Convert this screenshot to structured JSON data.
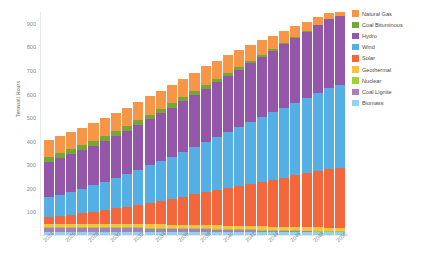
{
  "chart_data": {
    "type": "bar",
    "stacked": true,
    "title": "",
    "subtitle": "",
    "xlabel": "",
    "ylabel": "Terawatt Hours",
    "ylim": [
      0,
      950
    ],
    "yticks": [
      100,
      200,
      300,
      400,
      500,
      600,
      700,
      800,
      900
    ],
    "grid": false,
    "legend_position": "right",
    "x": [
      "2024",
      "2025",
      "2026",
      "2027",
      "2028",
      "2029",
      "2030",
      "2031",
      "2032",
      "2033",
      "2034",
      "2035",
      "2036",
      "2037",
      "2038",
      "2039",
      "2040",
      "2041",
      "2042",
      "2043",
      "2044",
      "2045",
      "2046",
      "2047",
      "2048",
      "2049",
      "2050"
    ],
    "xtick_labels": [
      "2024",
      "",
      "2026",
      "",
      "2028",
      "",
      "2030",
      "",
      "2032",
      "",
      "2034",
      "",
      "2036",
      "",
      "2038",
      "",
      "2040",
      "",
      "2042",
      "",
      "2044",
      "",
      "2046",
      "",
      "2048",
      "",
      "2050"
    ],
    "categories": [
      "2024",
      "2025",
      "2026",
      "2027",
      "2028",
      "2029",
      "2030",
      "2031",
      "2032",
      "2033",
      "2034",
      "2035",
      "2036",
      "2037",
      "2038",
      "2039",
      "2040",
      "2041",
      "2042",
      "2043",
      "2044",
      "2045",
      "2046",
      "2047",
      "2048",
      "2049",
      "2050"
    ],
    "stack_order_bottom_to_top": [
      "Biomass",
      "Coal Lignite",
      "Nuclear",
      "Geothermal",
      "Solar",
      "Wind",
      "Hydro",
      "Coal Bituminous",
      "Natural Gas"
    ],
    "series": [
      {
        "name": "Natural Gas",
        "color": "#f79646",
        "values": [
          72,
          73,
          74,
          74,
          75,
          75,
          76,
          76,
          77,
          77,
          78,
          78,
          79,
          79,
          80,
          78,
          76,
          72,
          68,
          62,
          56,
          50,
          44,
          38,
          32,
          25,
          18
        ]
      },
      {
        "name": "Coal Bituminous",
        "color": "#76a736",
        "values": [
          22,
          22,
          22,
          22,
          22,
          21,
          21,
          21,
          20,
          20,
          19,
          19,
          18,
          17,
          16,
          15,
          14,
          12,
          10,
          9,
          7,
          6,
          5,
          4,
          3,
          2,
          1
        ]
      },
      {
        "name": "Hydro",
        "color": "#9356a8",
        "values": [
          150,
          154,
          158,
          163,
          168,
          173,
          178,
          184,
          190,
          196,
          202,
          208,
          214,
          220,
          226,
          232,
          238,
          244,
          250,
          256,
          262,
          268,
          274,
          280,
          285,
          290,
          294
        ]
      },
      {
        "name": "Wind",
        "color": "#54b0e4",
        "values": [
          84,
          90,
          97,
          104,
          112,
          120,
          129,
          138,
          148,
          158,
          168,
          179,
          190,
          201,
          213,
          225,
          237,
          249,
          261,
          273,
          285,
          297,
          309,
          321,
          333,
          345,
          357
        ]
      },
      {
        "name": "Solar",
        "color": "#f4663c",
        "values": [
          28,
          33,
          39,
          45,
          52,
          59,
          67,
          75,
          83,
          92,
          101,
          110,
          119,
          129,
          139,
          149,
          159,
          169,
          179,
          189,
          199,
          209,
          219,
          229,
          239,
          249,
          259
        ]
      },
      {
        "name": "Geothermal",
        "color": "#f7c242",
        "values": [
          14,
          14,
          14,
          14,
          14,
          14,
          14,
          14,
          14,
          14,
          14,
          14,
          14,
          14,
          14,
          14,
          14,
          14,
          14,
          14,
          14,
          14,
          14,
          14,
          14,
          14,
          14
        ]
      },
      {
        "name": "Nuclear",
        "color": "#9fd13a",
        "values": [
          4,
          4,
          4,
          4,
          4,
          4,
          4,
          4,
          4,
          4,
          4,
          4,
          4,
          4,
          4,
          4,
          4,
          4,
          4,
          4,
          4,
          4,
          4,
          4,
          4,
          4,
          4
        ]
      },
      {
        "name": "Coal Lignite",
        "color": "#a87fbb",
        "values": [
          19,
          19,
          19,
          19,
          18,
          18,
          18,
          17,
          17,
          16,
          16,
          15,
          15,
          14,
          13,
          12,
          11,
          10,
          9,
          8,
          7,
          6,
          5,
          4,
          3,
          2,
          1
        ]
      },
      {
        "name": "Biomass",
        "color": "#8fd3f4",
        "values": [
          11,
          11,
          11,
          11,
          11,
          11,
          11,
          11,
          11,
          11,
          11,
          11,
          11,
          11,
          11,
          11,
          11,
          11,
          11,
          11,
          11,
          11,
          11,
          11,
          11,
          11,
          11
        ]
      }
    ],
    "totals": [
      404,
      420,
      438,
      456,
      476,
      495,
      518,
      540,
      564,
      588,
      613,
      638,
      664,
      689,
      716,
      740,
      764,
      785,
      806,
      826,
      845,
      865,
      885,
      905,
      924,
      941,
      959
    ]
  },
  "legend": {
    "items": [
      {
        "label": "Natural Gas",
        "color": "#f79646"
      },
      {
        "label": "Coal Bituminous",
        "color": "#76a736"
      },
      {
        "label": "Hydro",
        "color": "#9356a8"
      },
      {
        "label": "Wind",
        "color": "#54b0e4"
      },
      {
        "label": "Solar",
        "color": "#f4663c"
      },
      {
        "label": "Geothermal",
        "color": "#f7c242"
      },
      {
        "label": "Nuclear",
        "color": "#9fd13a"
      },
      {
        "label": "Coal Lignite",
        "color": "#a87fbb"
      },
      {
        "label": "Biomass",
        "color": "#8fd3f4"
      }
    ]
  }
}
